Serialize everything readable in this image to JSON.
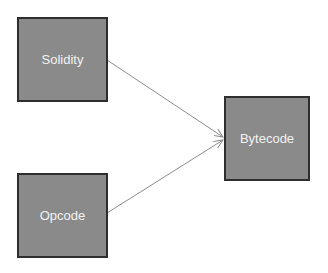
{
  "diagram": {
    "nodes": [
      {
        "id": "solidity",
        "label": "Solidity"
      },
      {
        "id": "opcode",
        "label": "Opcode"
      },
      {
        "id": "bytecode",
        "label": "Bytecode"
      }
    ],
    "edges": [
      {
        "from": "solidity",
        "to": "bytecode"
      },
      {
        "from": "opcode",
        "to": "bytecode"
      }
    ],
    "colors": {
      "box_fill": "#8a8a8a",
      "box_border": "#2e2e2e",
      "text": "#f2f2f2",
      "arrow": "#8c8c8c"
    }
  }
}
